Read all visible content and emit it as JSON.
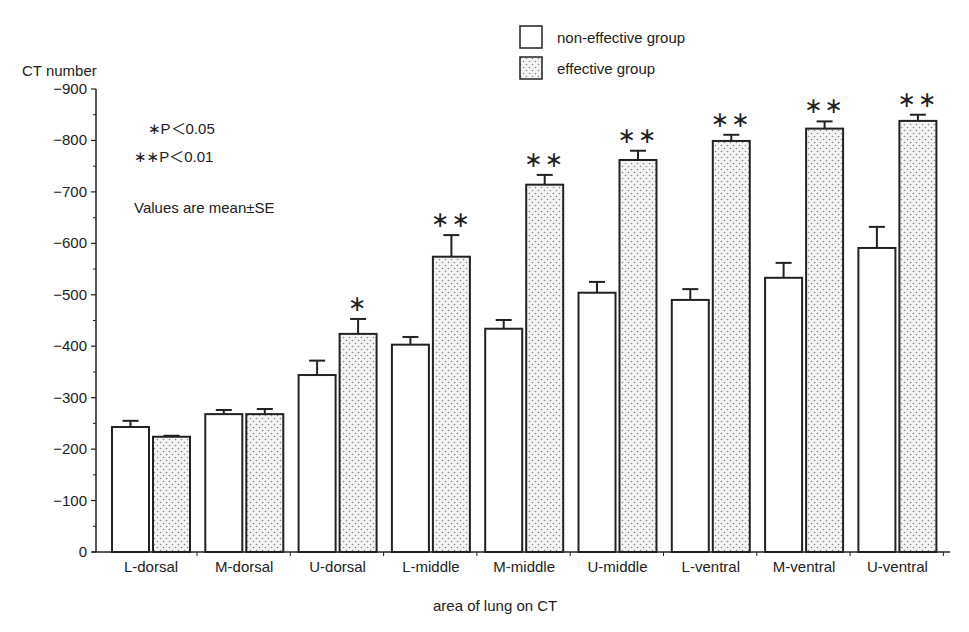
{
  "chart_data": {
    "type": "bar",
    "title": "",
    "xlabel": "area of lung on CT",
    "ylabel": "CT number",
    "ylim": [
      0,
      -900
    ],
    "yticks": [
      0,
      -100,
      -200,
      -300,
      -400,
      -500,
      -600,
      -700,
      -800,
      -900
    ],
    "ytick_labels": [
      "0",
      "−100",
      "−200",
      "−300",
      "−400",
      "−500",
      "−600",
      "−700",
      "−800",
      "−900"
    ],
    "grid": false,
    "legend_position": "top-right",
    "categories": [
      "L-dorsal",
      "M-dorsal",
      "U-dorsal",
      "L-middle",
      "M-middle",
      "U-middle",
      "L-ventral",
      "M-ventral",
      "U-ventral"
    ],
    "series": [
      {
        "name": "non-effective group",
        "fill": "white",
        "values": [
          -243,
          -268,
          -344,
          -403,
          -434,
          -504,
          -490,
          -533,
          -591
        ],
        "se": [
          12,
          8,
          28,
          15,
          17,
          21,
          21,
          29,
          41
        ]
      },
      {
        "name": "effective group",
        "fill": "dotted",
        "values": [
          -224,
          -268,
          -424,
          -574,
          -714,
          -762,
          -799,
          -823,
          -838
        ],
        "se": [
          2,
          10,
          29,
          42,
          19,
          18,
          12,
          14,
          12
        ]
      }
    ],
    "significance": [
      "",
      "",
      "*",
      "**",
      "**",
      "**",
      "**",
      "**",
      "**"
    ],
    "annotations": [
      "∗P＜0.05",
      "∗∗P＜0.01",
      "Values are mean±SE"
    ]
  },
  "legend": {
    "items": [
      {
        "label": "non-effective group",
        "pattern": "white"
      },
      {
        "label": "effective group",
        "pattern": "dotted"
      }
    ]
  },
  "notes": {
    "p05": "∗P＜0.05",
    "p01": "∗∗P＜0.01",
    "values": "Values are mean±SE"
  },
  "axis": {
    "ylabel": "CT number",
    "xlabel": "area of lung on CT"
  }
}
